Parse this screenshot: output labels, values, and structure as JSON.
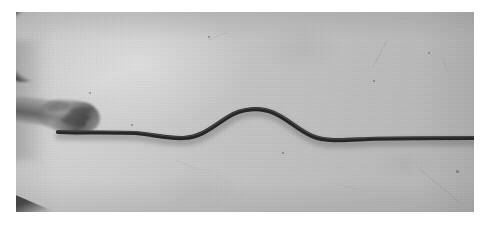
{
  "figure": {
    "kind": "photograph",
    "color_mode": "grayscale",
    "width_px": 491,
    "height_px": 229
  },
  "plate": {
    "label": "photographic plate",
    "left_px": 16,
    "top_px": 12,
    "width_px": 458,
    "height_px": 200,
    "background_light": "#cfcfcf",
    "background_dark": "#b6b6b6",
    "page_margin_color": "#ffffff"
  },
  "subjects": [
    {
      "id": "shoulder-arc",
      "label": "shoulder and upper arm silhouette",
      "position": "top-left",
      "tone": "#343434"
    },
    {
      "id": "forearm",
      "label": "forearm",
      "position": "left",
      "tone": "#4e4e4e"
    },
    {
      "id": "hand",
      "label": "hand gripping the rope",
      "position": "left-centre",
      "tone": "#5a5a5a"
    },
    {
      "id": "elbow-wedge",
      "label": "dark wedge of second arm",
      "position": "bottom-left",
      "tone": "#282828"
    }
  ],
  "rope": {
    "label": "rope carrying the pulse",
    "color": "#262626",
    "highlight_color": "#6a6a6a",
    "thickness_px": 4.2,
    "anchor_x_px": 58,
    "free_end_x_px": 458,
    "baseline_y_left_px": 120,
    "baseline_y_right_px": 126,
    "path": "M 42 120 C 70 121, 96 120, 120 121 C 140 123, 152 127, 168 126 C 186 125, 196 115, 212 105 C 226 96, 244 95, 258 101 C 272 107, 282 118, 296 124 C 310 130, 330 128, 352 127 C 380 126, 420 126, 458 126"
  },
  "chart_data": {
    "type": "line",
    "xlabel": "distance along rope (px)",
    "ylabel": "vertical displacement (px, image coords)",
    "xlim": [
      42,
      458
    ],
    "ylim": [
      95,
      132
    ],
    "grid": false,
    "legend": "none",
    "series": [
      {
        "name": "rope profile",
        "x": [
          42,
          70,
          96,
          120,
          140,
          152,
          168,
          186,
          196,
          212,
          226,
          244,
          258,
          272,
          282,
          296,
          310,
          330,
          352,
          380,
          420,
          458
        ],
        "y": [
          120,
          121,
          120,
          121,
          123,
          127,
          126,
          125,
          115,
          105,
          96,
          95,
          101,
          107,
          118,
          124,
          130,
          128,
          127,
          126,
          126,
          126
        ]
      }
    ],
    "annotations": [
      {
        "text": "crest of pulse",
        "x": 236,
        "y": 95
      },
      {
        "text": "hand / driving end",
        "x": 50,
        "y": 120
      },
      {
        "text": "undisturbed rope",
        "x": 420,
        "y": 126
      }
    ]
  },
  "blemishes": {
    "label": "film scratches and dust specks",
    "scratches": [
      {
        "x_pct": 81,
        "y_pct": 14,
        "len_px": 30,
        "angle_deg": 118,
        "opacity": 0.32
      },
      {
        "x_pct": 88,
        "y_pct": 78,
        "len_px": 54,
        "angle_deg": 40,
        "opacity": 0.3
      },
      {
        "x_pct": 46,
        "y_pct": 10,
        "len_px": 20,
        "angle_deg": 158,
        "opacity": 0.24
      },
      {
        "x_pct": 35,
        "y_pct": 74,
        "len_px": 26,
        "angle_deg": 22,
        "opacity": 0.2
      },
      {
        "x_pct": 93,
        "y_pct": 22,
        "len_px": 16,
        "angle_deg": 70,
        "opacity": 0.28
      },
      {
        "x_pct": 70,
        "y_pct": 86,
        "len_px": 22,
        "angle_deg": 12,
        "opacity": 0.18
      }
    ],
    "specks": [
      {
        "x_pct": 42,
        "y_pct": 12,
        "d_px": 2
      },
      {
        "x_pct": 58,
        "y_pct": 70,
        "d_px": 2
      },
      {
        "x_pct": 90,
        "y_pct": 20,
        "d_px": 2
      },
      {
        "x_pct": 25,
        "y_pct": 56,
        "d_px": 2
      },
      {
        "x_pct": 96,
        "y_pct": 79,
        "d_px": 3
      },
      {
        "x_pct": 16,
        "y_pct": 40,
        "d_px": 2
      },
      {
        "x_pct": 78,
        "y_pct": 34,
        "d_px": 2
      }
    ]
  }
}
